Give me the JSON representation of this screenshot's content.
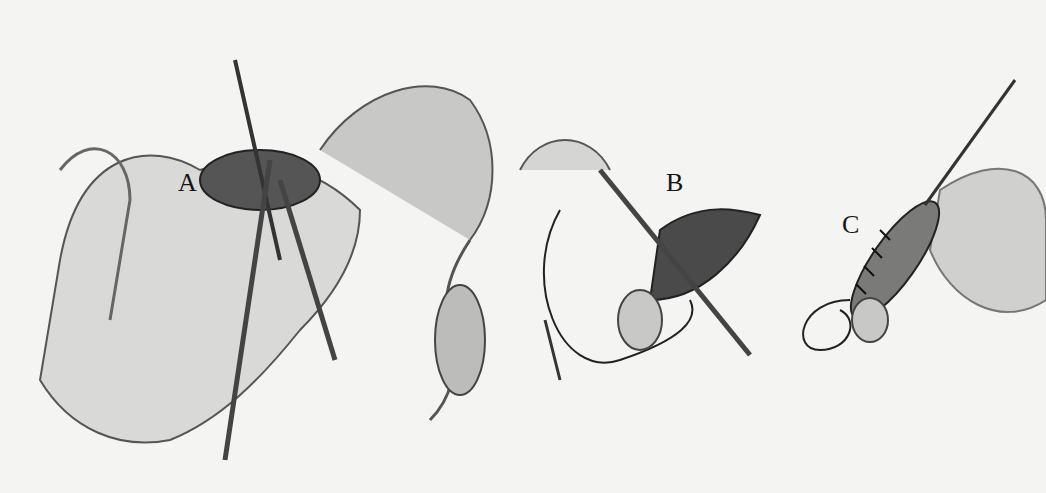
{
  "figure": {
    "panels": [
      {
        "label": "A",
        "x": 178,
        "y": 190
      },
      {
        "label": "B",
        "x": 666,
        "y": 174
      },
      {
        "label": "C",
        "x": 842,
        "y": 208
      }
    ],
    "colors": {
      "background": "#f4f4f3",
      "ink": "#151515",
      "shade": "#8a8a8a"
    }
  }
}
